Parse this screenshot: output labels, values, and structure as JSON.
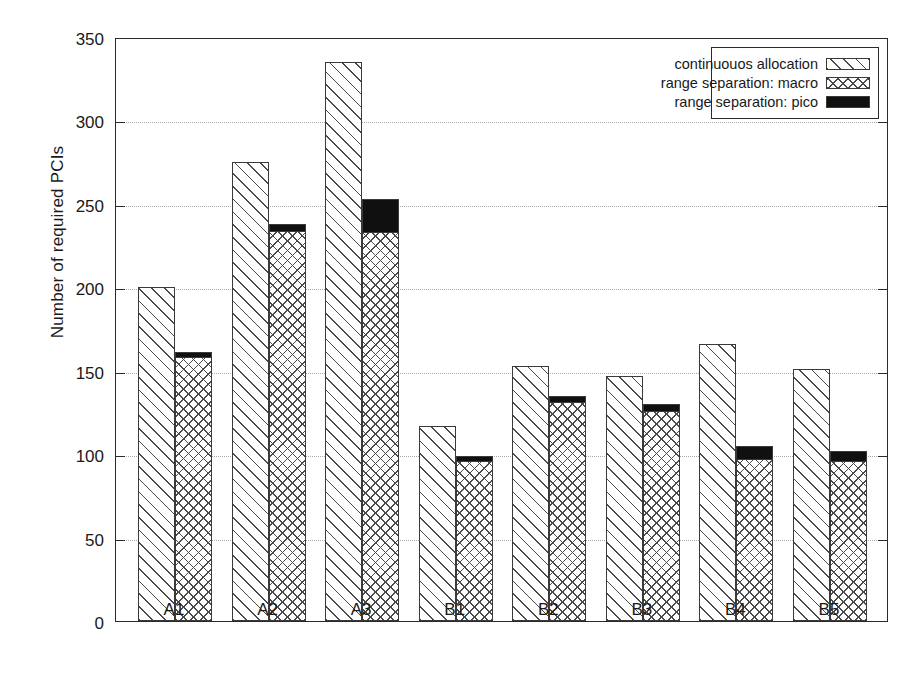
{
  "chart_data": {
    "type": "bar",
    "title": "",
    "xlabel": "",
    "ylabel": "Number of required PCIs",
    "categories": [
      "A1",
      "A2",
      "A3",
      "B1",
      "B2",
      "B3",
      "B4",
      "B5"
    ],
    "ylim": [
      0,
      350
    ],
    "yticks": [
      0,
      50,
      100,
      150,
      200,
      250,
      300,
      350
    ],
    "grid": true,
    "legend_position": "top-right",
    "series": [
      {
        "name": "continuouos allocation",
        "pattern": "diagonal-hatch",
        "stacked": false,
        "values": [
          200,
          275,
          335,
          117,
          153,
          147,
          166,
          151
        ]
      },
      {
        "name": "range separation: macro",
        "pattern": "cross-hatch",
        "stacked": true,
        "values": [
          158,
          234,
          233,
          96,
          131,
          126,
          97,
          96
        ]
      },
      {
        "name": "range separation: pico",
        "pattern": "solid-black",
        "stacked": true,
        "values": [
          3,
          4,
          20,
          3,
          4,
          4,
          8,
          6
        ]
      }
    ],
    "stack_totals": [
      161,
      238,
      253,
      99,
      135,
      130,
      105,
      102
    ],
    "colors": {
      "axis": "#2a2a2a",
      "grid": "#aaaaaa",
      "hatch": "#4a4a4a",
      "solid": "#101010",
      "background": "#ffffff"
    }
  },
  "axis": {
    "ytick_labels": [
      "0",
      "50",
      "100",
      "150",
      "200",
      "250",
      "300",
      "350"
    ],
    "xtick_labels": [
      "A1",
      "A2",
      "A3",
      "B1",
      "B2",
      "B3",
      "B4",
      "B5"
    ],
    "ylabel": "Number of required PCIs"
  },
  "legend": {
    "entries": [
      {
        "label": "continuouos allocation",
        "swatch": "diagonal-hatch-swatch"
      },
      {
        "label": "range separation: macro",
        "swatch": "cross-hatch-swatch"
      },
      {
        "label": "range separation: pico",
        "swatch": "solid-black-swatch"
      }
    ]
  }
}
